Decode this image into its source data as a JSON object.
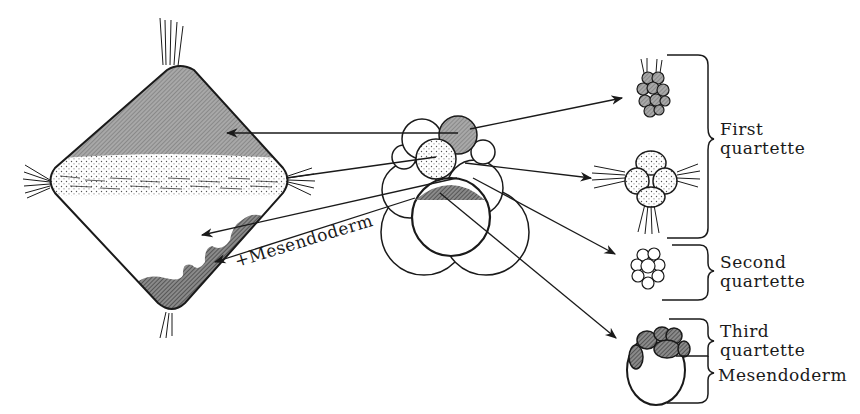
{
  "diagram": {
    "type": "cell-lineage fate diagram",
    "left_figure": "trochophore larva",
    "center_figure": "spiral-cleavage embryo",
    "labels": {
      "first_quartette": [
        "First",
        "quartette"
      ],
      "second_quartette": [
        "Second",
        "quartette"
      ],
      "third_quartette": [
        "Third",
        "quartette"
      ],
      "mesendoderm": "Mesendoderm",
      "larva_mesendoderm": "+Mesendoderm"
    },
    "right_figures": [
      {
        "name": "apical-rosette",
        "group": "first_quartette"
      },
      {
        "name": "prototroch-cells",
        "group": "first_quartette"
      },
      {
        "name": "second-quartette-cells",
        "group": "second_quartette"
      },
      {
        "name": "third-quartette-and-mesendoderm",
        "group": "third_quartette"
      }
    ],
    "colors": {
      "ink": "#1a1a1a",
      "hatch_gray": "#9a9a9a",
      "dark_hatch": "#6e6e6e",
      "background": "#ffffff"
    }
  }
}
